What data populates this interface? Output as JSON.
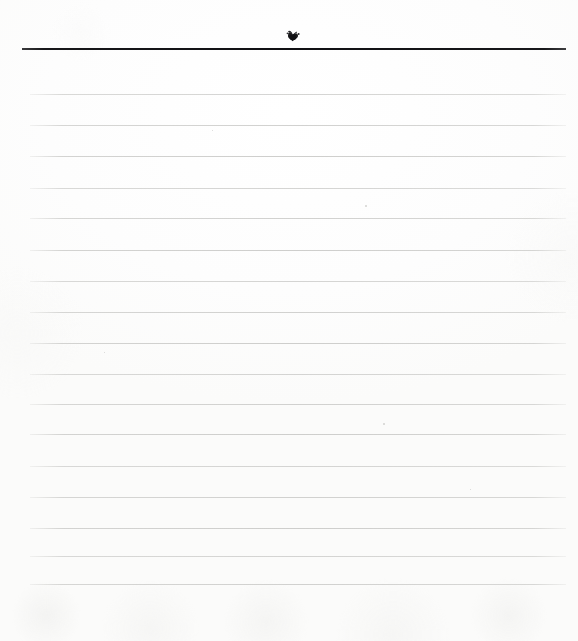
{
  "page": {
    "kind": "scanned-blank-ruled-paper",
    "width_px": 578,
    "height_px": 641,
    "background_color": "#fdfdfc",
    "paper_tone": "#ffffff",
    "content_text": "",
    "is_blank": "true"
  },
  "header": {
    "rule": {
      "label": "header-rule",
      "color": "#101013",
      "y_px": 48,
      "x_start_px": 22,
      "x_end_px": 566,
      "thickness_px": 2
    },
    "ornament": {
      "label": "ink-mark",
      "description": "small dark ink blob",
      "color": "#1b1b1d",
      "x_px": 285,
      "y_px": 30,
      "width_px": 17,
      "height_px": 13
    }
  },
  "ruling": {
    "label": "ruled-lines",
    "line_color": "#cfcfcd",
    "x_start_px": 30,
    "x_end_px": 566,
    "thickness_px": 1,
    "spacing_px": 31,
    "count": 17,
    "y_positions": [
      94,
      125,
      156,
      188,
      218,
      250,
      281,
      312,
      343,
      374,
      404,
      434,
      466,
      497,
      528,
      556,
      584
    ]
  },
  "margins": {
    "top_px": 48,
    "left_px": 30,
    "right_px": 12,
    "bottom_px": 57
  },
  "artifacts": {
    "label": "scan-specks",
    "items": [
      {
        "x_px": 365,
        "y_px": 205,
        "size_px": 2
      },
      {
        "x_px": 383,
        "y_px": 423,
        "size_px": 2
      },
      {
        "x_px": 212,
        "y_px": 130,
        "size_px": 1
      },
      {
        "x_px": 104,
        "y_px": 352,
        "size_px": 1
      },
      {
        "x_px": 470,
        "y_px": 489,
        "size_px": 1
      }
    ]
  }
}
